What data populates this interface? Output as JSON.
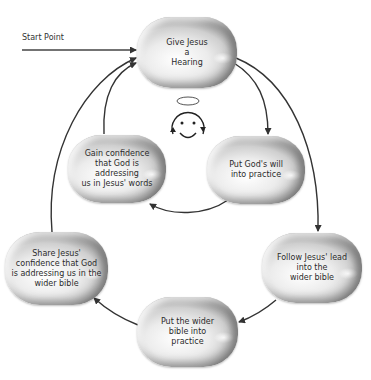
{
  "diagram": {
    "start_label": "Start Point",
    "nodes": [
      {
        "id": "give-jesus-a-hearing",
        "label": "Give Jesus\na\nHearing"
      },
      {
        "id": "gain-confidence",
        "label": "Gain confidence\nthat God is addressing\nus in Jesus' words"
      },
      {
        "id": "put-gods-will",
        "label": "Put God's will\ninto practice"
      },
      {
        "id": "share-confidence",
        "label": "Share Jesus'\nconfidence that God\nis addressing us in the\nwider bible"
      },
      {
        "id": "follow-jesus-lead",
        "label": "Follow Jesus' lead\ninto the\nwider bible"
      },
      {
        "id": "put-wider-bible",
        "label": "Put the wider\nbible into\npractice"
      }
    ],
    "edges": [
      {
        "from": "start",
        "to": "give-jesus-a-hearing"
      },
      {
        "from": "give-jesus-a-hearing",
        "to": "put-gods-will"
      },
      {
        "from": "put-gods-will",
        "to": "gain-confidence"
      },
      {
        "from": "gain-confidence",
        "to": "give-jesus-a-hearing"
      },
      {
        "from": "give-jesus-a-hearing",
        "to": "follow-jesus-lead"
      },
      {
        "from": "follow-jesus-lead",
        "to": "put-wider-bible"
      },
      {
        "from": "put-wider-bible",
        "to": "share-confidence"
      },
      {
        "from": "share-confidence",
        "to": "give-jesus-a-hearing"
      }
    ],
    "center_icon": "smiley-with-halo-icon",
    "colors": {
      "line": "#333333",
      "node_light": "#ffffff",
      "node_dark": "#8e8e8e",
      "text": "#2b2b2b"
    }
  }
}
